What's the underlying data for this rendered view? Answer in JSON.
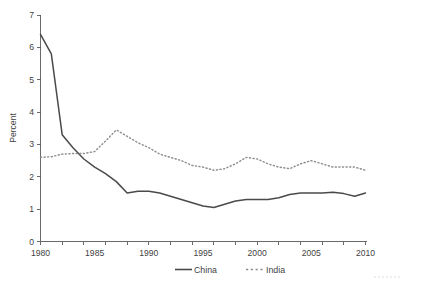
{
  "chart_data": {
    "type": "line",
    "title": "",
    "subtitle": "",
    "xlabel": "",
    "ylabel": "Percent",
    "xlim": [
      1980,
      2010
    ],
    "ylim": [
      0,
      7
    ],
    "yticks": [
      0,
      1,
      2,
      3,
      4,
      5,
      6,
      7
    ],
    "ytick_labels": [
      "0",
      "1",
      "2",
      "3",
      "4",
      "5",
      "6",
      "7"
    ],
    "xticks": [
      1980,
      1985,
      1990,
      1995,
      2000,
      2005,
      2010
    ],
    "xtick_labels": [
      "1980",
      "1985",
      "1990",
      "1995",
      "2000",
      "2005",
      "2010"
    ],
    "x_minor_tick_interval": 1,
    "grid": false,
    "legend_position": "bottom-center",
    "x": [
      1980,
      1981,
      1982,
      1983,
      1984,
      1985,
      1986,
      1987,
      1988,
      1989,
      1990,
      1991,
      1992,
      1993,
      1994,
      1995,
      1996,
      1997,
      1998,
      1999,
      2000,
      2001,
      2002,
      2003,
      2004,
      2005,
      2006,
      2007,
      2008,
      2009,
      2010
    ],
    "series": [
      {
        "name": "China",
        "style": "solid",
        "color": "#4a4a4a",
        "values": [
          6.4,
          5.8,
          3.3,
          2.9,
          2.55,
          2.3,
          2.1,
          1.85,
          1.5,
          1.55,
          1.55,
          1.5,
          1.4,
          1.3,
          1.2,
          1.1,
          1.05,
          1.15,
          1.25,
          1.3,
          1.3,
          1.3,
          1.35,
          1.45,
          1.5,
          1.5,
          1.5,
          1.52,
          1.48,
          1.4,
          1.5
        ]
      },
      {
        "name": "India",
        "style": "dotted",
        "color": "#8e8e8e",
        "values": [
          2.6,
          2.62,
          2.7,
          2.72,
          2.72,
          2.78,
          3.1,
          3.45,
          3.25,
          3.05,
          2.9,
          2.7,
          2.6,
          2.5,
          2.35,
          2.3,
          2.2,
          2.25,
          2.4,
          2.6,
          2.55,
          2.4,
          2.3,
          2.25,
          2.4,
          2.5,
          2.4,
          2.3,
          2.3,
          2.3,
          2.2
        ]
      }
    ],
    "legend": [
      {
        "label": "China",
        "style": "solid",
        "color": "#4a4a4a"
      },
      {
        "label": "India",
        "style": "dotted",
        "color": "#8e8e8e"
      }
    ],
    "axis_color": "#5a5a5a"
  }
}
